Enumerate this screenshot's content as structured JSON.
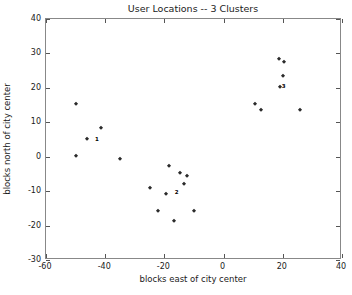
{
  "chart_data": {
    "type": "scatter",
    "title": "User Locations -- 3 Clusters",
    "xlabel": "blocks east of city center",
    "ylabel": "blocks north of city center",
    "xlim": [
      -60,
      40
    ],
    "ylim": [
      -30,
      40
    ],
    "xticks": [
      -60,
      -40,
      -20,
      0,
      20,
      40
    ],
    "yticks": [
      -30,
      -20,
      -10,
      0,
      10,
      20,
      30,
      40
    ],
    "xticklabels": [
      "-60",
      "-40",
      "-20",
      "0",
      "20",
      "40"
    ],
    "yticklabels": [
      "-30",
      "-20",
      "-10",
      "0",
      "10",
      "20",
      "30",
      "40"
    ],
    "grid": false,
    "legend": false,
    "marker": "diamond",
    "marker_color": "#2b2b2b",
    "background_color": "#ffffff",
    "frame_color": "#888888",
    "series": [
      {
        "name": "1",
        "label": "1",
        "label_x": -44.5,
        "label_y": 5.0,
        "points": [
          {
            "x": -50.0,
            "y": 15.2
          },
          {
            "x": -46.3,
            "y": 5.2
          },
          {
            "x": -41.5,
            "y": 8.4
          },
          {
            "x": -50.0,
            "y": 0.2
          }
        ]
      },
      {
        "name": "2",
        "label": "2",
        "label_x": -17.5,
        "label_y": -10.4,
        "points": [
          {
            "x": -35.0,
            "y": -0.7
          },
          {
            "x": -25.0,
            "y": -9.0
          },
          {
            "x": -18.6,
            "y": -2.8
          },
          {
            "x": -14.6,
            "y": -4.8
          },
          {
            "x": -12.5,
            "y": -5.7
          },
          {
            "x": -13.3,
            "y": -7.9
          },
          {
            "x": -19.3,
            "y": -10.8
          },
          {
            "x": -22.1,
            "y": -15.8
          },
          {
            "x": -16.8,
            "y": -18.7
          },
          {
            "x": -10.0,
            "y": -15.7
          }
        ]
      },
      {
        "name": "3",
        "label": "3",
        "label_x": 18.6,
        "label_y": 20.2,
        "points": [
          {
            "x": 18.6,
            "y": 28.4
          },
          {
            "x": 20.5,
            "y": 27.4
          },
          {
            "x": 20.0,
            "y": 23.4
          },
          {
            "x": 19.0,
            "y": 20.2
          },
          {
            "x": 10.6,
            "y": 15.4
          },
          {
            "x": 12.8,
            "y": 13.5
          },
          {
            "x": 25.7,
            "y": 13.5
          }
        ]
      }
    ]
  },
  "artifact": {
    "text": ""
  }
}
